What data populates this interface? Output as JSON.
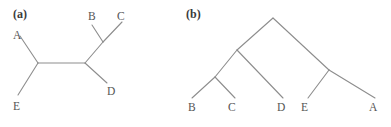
{
  "figure": {
    "width": 391,
    "height": 127,
    "background": "#ffffff",
    "line_color": "#8d8d8d",
    "text_color": "#555555",
    "panel_label_color": "#3a3a3a"
  },
  "panels": [
    {
      "id": "a",
      "label": "(a)",
      "label_x": 13,
      "label_y": 8,
      "tree_type": "unrooted",
      "taxa": [
        {
          "name": "A",
          "label": "A",
          "label_x": 13,
          "label_y": 30
        },
        {
          "name": "B",
          "label": "B",
          "label_x": 88,
          "label_y": 11
        },
        {
          "name": "C",
          "label": "C",
          "label_x": 117,
          "label_y": 11
        },
        {
          "name": "D",
          "label": "D",
          "label_x": 107,
          "label_y": 86
        },
        {
          "name": "E",
          "label": "E",
          "label_x": 13,
          "label_y": 101
        }
      ],
      "nodes": [
        {
          "name": "node-left",
          "x": 38,
          "y": 63
        },
        {
          "name": "node-right",
          "x": 85,
          "y": 63
        },
        {
          "name": "node-bc",
          "x": 103,
          "y": 42
        }
      ],
      "edges": [
        {
          "name": "edge-A-to-node-left",
          "x1": 20,
          "y1": 36,
          "x2": 38,
          "y2": 63
        },
        {
          "name": "edge-E-to-node-left",
          "x1": 18,
          "y1": 95,
          "x2": 38,
          "y2": 63
        },
        {
          "name": "edge-node-left-to-node-right",
          "x1": 38,
          "y1": 63,
          "x2": 85,
          "y2": 63
        },
        {
          "name": "edge-D-to-node-right",
          "x1": 85,
          "y1": 63,
          "x2": 107,
          "y2": 83
        },
        {
          "name": "edge-node-right-to-node-bc",
          "x1": 85,
          "y1": 63,
          "x2": 103,
          "y2": 42
        },
        {
          "name": "edge-B-to-node-bc",
          "x1": 103,
          "y1": 42,
          "x2": 92,
          "y2": 25
        },
        {
          "name": "edge-C-to-node-bc",
          "x1": 103,
          "y1": 42,
          "x2": 122,
          "y2": 22
        }
      ]
    },
    {
      "id": "b",
      "label": "(b)",
      "label_x": 6,
      "label_y": 8,
      "tree_type": "rooted",
      "taxa": [
        {
          "name": "B",
          "label": "B",
          "label_x": 8,
          "label_y": 102
        },
        {
          "name": "C",
          "label": "C",
          "label_x": 48,
          "label_y": 102
        },
        {
          "name": "D",
          "label": "D",
          "label_x": 97,
          "label_y": 102
        },
        {
          "name": "E",
          "label": "E",
          "label_x": 121,
          "label_y": 102
        },
        {
          "name": "A",
          "label": "A",
          "label_x": 189,
          "label_y": 102
        }
      ],
      "nodes": [
        {
          "name": "node-root",
          "x": 93,
          "y": 18
        },
        {
          "name": "node-bcd",
          "x": 57,
          "y": 50
        },
        {
          "name": "node-bc",
          "x": 35,
          "y": 77
        },
        {
          "name": "node-ea",
          "x": 149,
          "y": 70
        }
      ],
      "edges": [
        {
          "name": "edge-root-to-node-bcd",
          "x1": 93,
          "y1": 18,
          "x2": 57,
          "y2": 50
        },
        {
          "name": "edge-root-to-node-ea",
          "x1": 93,
          "y1": 18,
          "x2": 149,
          "y2": 70
        },
        {
          "name": "edge-node-bcd-to-bc",
          "x1": 57,
          "y1": 50,
          "x2": 35,
          "y2": 77
        },
        {
          "name": "edge-node-bcd-to-D",
          "x1": 57,
          "y1": 50,
          "x2": 103,
          "y2": 98
        },
        {
          "name": "edge-node-bc-to-B",
          "x1": 35,
          "y1": 77,
          "x2": 12,
          "y2": 98
        },
        {
          "name": "edge-node-bc-to-C",
          "x1": 35,
          "y1": 77,
          "x2": 55,
          "y2": 98
        },
        {
          "name": "edge-node-ea-to-E",
          "x1": 149,
          "y1": 70,
          "x2": 128,
          "y2": 98
        },
        {
          "name": "edge-node-ea-to-A",
          "x1": 149,
          "y1": 70,
          "x2": 195,
          "y2": 98
        }
      ]
    }
  ]
}
